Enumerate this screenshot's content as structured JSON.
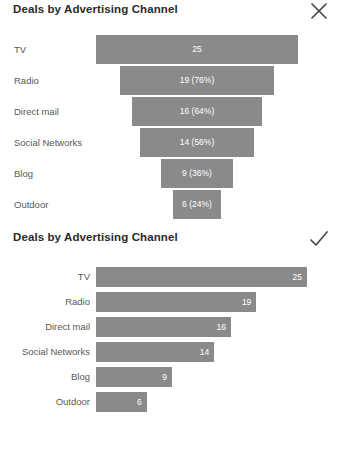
{
  "colors": {
    "bar": "#8a8a8a",
    "title_text": "#2b2b2b",
    "label_text": "#585858",
    "value_text": "#ffffff",
    "icon": "#4a4a4a",
    "background": "#ffffff"
  },
  "panels": [
    {
      "title": "Deals by Advertising Channel",
      "verdict": "cross-icon",
      "chart_data": {
        "type": "bar",
        "variant": "funnel",
        "title": "Deals by Advertising Channel",
        "xlabel": "",
        "ylabel": "",
        "orientation": "horizontal",
        "centered": true,
        "grid": false,
        "legend": "none",
        "xlim": [
          0,
          25
        ],
        "categories": [
          "TV",
          "Radio",
          "Direct mail",
          "Social Networks",
          "Blog",
          "Outdoor"
        ],
        "values": [
          25,
          19,
          16,
          14,
          9,
          6
        ],
        "percent_of_first": [
          100,
          76,
          64,
          56,
          36,
          24
        ],
        "data_labels": [
          "25",
          "19 (76%)",
          "16 (64%)",
          "14 (56%)",
          "9 (36%)",
          "6 (24%)"
        ]
      }
    },
    {
      "title": "Deals by Advertising Channel",
      "verdict": "check-icon",
      "chart_data": {
        "type": "bar",
        "variant": "horizontal-bar",
        "title": "Deals by Advertising Channel",
        "xlabel": "",
        "ylabel": "",
        "orientation": "horizontal",
        "centered": false,
        "grid": false,
        "legend": "none",
        "xlim": [
          0,
          25
        ],
        "categories": [
          "TV",
          "Radio",
          "Direct mail",
          "Social Networks",
          "Blog",
          "Outdoor"
        ],
        "values": [
          25,
          19,
          16,
          14,
          9,
          6
        ],
        "data_labels": [
          "25",
          "19",
          "16",
          "14",
          "9",
          "6"
        ]
      }
    }
  ]
}
